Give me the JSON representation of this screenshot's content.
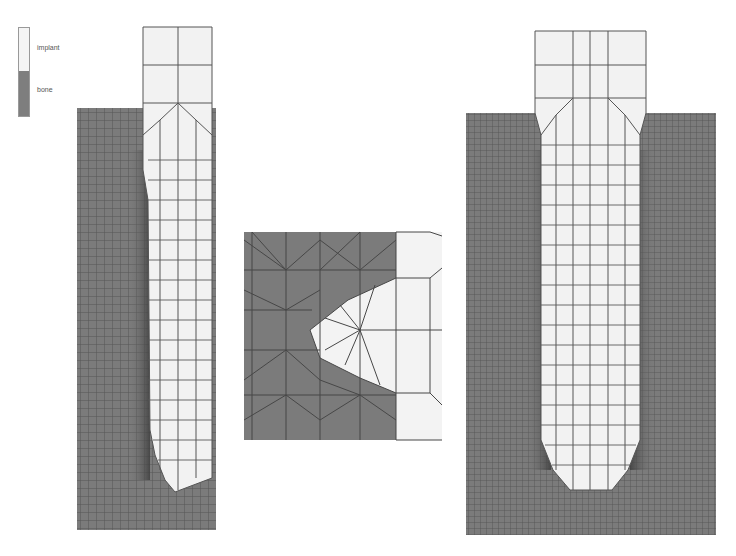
{
  "legend": {
    "items": [
      {
        "label": "implant",
        "color": "#f2f2f2"
      },
      {
        "label": "bone",
        "color": "#7a7a7a"
      }
    ]
  },
  "figures": [
    {
      "name": "left-model",
      "description": "Finite element mesh of implant inserted in bone (half model)"
    },
    {
      "name": "thread-detail",
      "description": "Magnified mesh of a single thread at implant-bone interface"
    },
    {
      "name": "right-model",
      "description": "Finite element mesh of implant inserted in bone (full model)"
    }
  ],
  "colors": {
    "bone": "#7a7a7a",
    "implant": "#f2f2f2",
    "mesh_line": "#444444",
    "interface_dark": "#4a4a4a"
  }
}
